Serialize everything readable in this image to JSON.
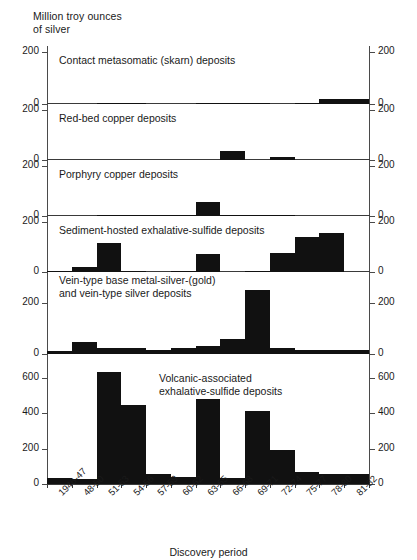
{
  "figure": {
    "y_axis_label": "Million troy ounces\nof silver",
    "x_axis_label": "Discovery period"
  },
  "chart_data": {
    "type": "bar",
    "title": "",
    "subtitle": "",
    "ylabel": "Million troy ounces of silver",
    "xlabel": "Discovery period",
    "grid": false,
    "legend": "none",
    "orientation": "vertical",
    "layout": "six stacked panels sharing one category axis; y tick labels mirrored on left and right",
    "categories": [
      "1946-47",
      "48-50",
      "51-53",
      "54-56",
      "57-59",
      "60-62",
      "63-65",
      "66-68",
      "69-71",
      "72-74",
      "75-77",
      "78-80",
      "81-82"
    ],
    "panels": [
      {
        "name": "contact-metasomatic",
        "label": "Contact metasomatic (skarn) deposits",
        "ylim": [
          0,
          200
        ],
        "yticks": [
          0,
          200
        ],
        "ytick_labels": [
          "0",
          "200"
        ],
        "values": [
          0,
          0,
          2,
          2,
          0,
          0,
          4,
          2,
          3,
          0,
          3,
          18,
          18
        ]
      },
      {
        "name": "red-bed-copper",
        "label": "Red-bed copper deposits",
        "ylim": [
          0,
          200
        ],
        "yticks": [
          0,
          200
        ],
        "ytick_labels": [
          "0",
          "200"
        ],
        "values": [
          0,
          0,
          0,
          0,
          0,
          0,
          0,
          38,
          0,
          12,
          0,
          0,
          0
        ]
      },
      {
        "name": "porphyry-copper",
        "label": "Porphyry copper deposits",
        "ylim": [
          0,
          200
        ],
        "yticks": [
          0,
          200
        ],
        "ytick_labels": [
          "0",
          "200"
        ],
        "values": [
          0,
          0,
          3,
          3,
          3,
          3,
          58,
          6,
          6,
          6,
          0,
          0,
          0
        ]
      },
      {
        "name": "sediment-hosted-exhalative-sulfide",
        "label": "Sediment-hosted exhalative-sulfide deposits",
        "ylim": [
          0,
          200
        ],
        "yticks": [
          0,
          200
        ],
        "ytick_labels": [
          "0",
          "200"
        ],
        "values": [
          2,
          22,
          115,
          2,
          0,
          2,
          72,
          0,
          2,
          78,
          140,
          158,
          0
        ]
      },
      {
        "name": "vein-type-base-metal-silver-gold",
        "label": "Vein-type base metal-silver-(gold)\nand vein-type silver deposits",
        "ylim": [
          0,
          300
        ],
        "yticks": [
          0,
          200
        ],
        "ytick_labels": [
          "0",
          "200"
        ],
        "values": [
          12,
          48,
          22,
          25,
          14,
          24,
          32,
          58,
          252,
          22,
          16,
          16,
          16
        ]
      },
      {
        "name": "volcanic-associated-exhalative-sulfide",
        "label": "Volcanic-associated\nexhalative-sulfide deposits",
        "ylim": [
          0,
          700
        ],
        "yticks": [
          0,
          200,
          400,
          600
        ],
        "ytick_labels": [
          "0",
          "200",
          "400",
          "600"
        ],
        "values": [
          32,
          28,
          632,
          447,
          55,
          38,
          482,
          32,
          412,
          192,
          68,
          58,
          55
        ]
      }
    ]
  }
}
